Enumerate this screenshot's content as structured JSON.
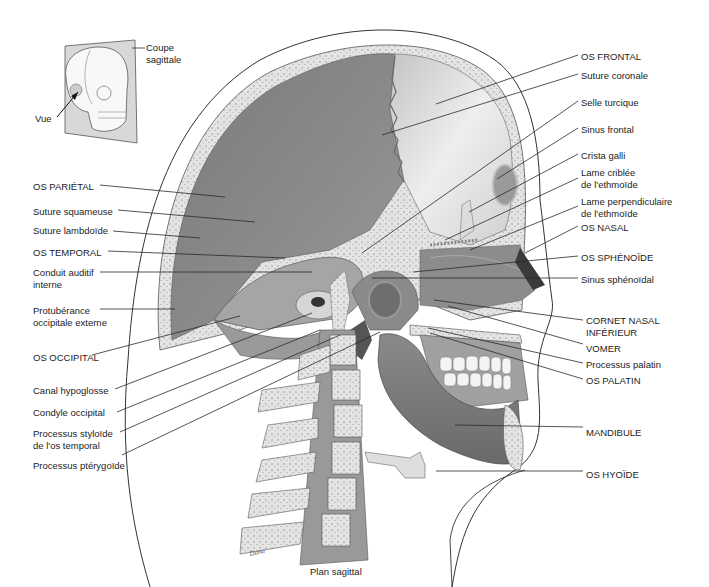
{
  "diagram": {
    "type": "anatomical-illustration",
    "caption": "Plan sagittal",
    "inset": {
      "plane_label": "Coupe\nsagittale",
      "view_label": "Vue"
    },
    "colors": {
      "background": "#ffffff",
      "bone_dark": "#6f6f6f",
      "bone_mid": "#9a9a9a",
      "bone_light": "#d9d9d9",
      "spongy": "#e6e6e6",
      "leader_line": "#2a2a2a"
    },
    "labels_left": [
      {
        "text": "OS PARIÉTAL",
        "x": 33,
        "y": 181
      },
      {
        "text": "Suture squameuse",
        "x": 33,
        "y": 206
      },
      {
        "text": "Suture lambdoïde",
        "x": 33,
        "y": 225
      },
      {
        "text": "OS TEMPORAL",
        "x": 33,
        "y": 247
      },
      {
        "text": "Conduit auditif\ninterne",
        "x": 33,
        "y": 267
      },
      {
        "text": "Protubérance\noccipitale externe",
        "x": 33,
        "y": 305
      },
      {
        "text": "OS OCCIPITAL",
        "x": 33,
        "y": 352
      },
      {
        "text": "Canal hypoglosse",
        "x": 33,
        "y": 385
      },
      {
        "text": "Condyle occipital",
        "x": 33,
        "y": 407
      },
      {
        "text": "Processus styloïde\nde l'os temporal",
        "x": 33,
        "y": 428
      },
      {
        "text": "Processus ptérygoïde",
        "x": 33,
        "y": 460
      }
    ],
    "labels_right": [
      {
        "text": "OS FRONTAL",
        "x": 581,
        "y": 51
      },
      {
        "text": "Suture coronale",
        "x": 581,
        "y": 70
      },
      {
        "text": "Selle turcique",
        "x": 581,
        "y": 97
      },
      {
        "text": "Sinus frontal",
        "x": 581,
        "y": 124
      },
      {
        "text": "Crista galli",
        "x": 581,
        "y": 150
      },
      {
        "text": "Lame criblée\nde l'ethmoïde",
        "x": 581,
        "y": 167
      },
      {
        "text": "Lame perpendiculaire\nde l'ethmoïde",
        "x": 581,
        "y": 196
      },
      {
        "text": "OS NASAL",
        "x": 581,
        "y": 222
      },
      {
        "text": "OS SPHÉNOÏDE",
        "x": 581,
        "y": 252
      },
      {
        "text": "Sinus sphénoïdal",
        "x": 581,
        "y": 274
      },
      {
        "text": "CORNET NASAL\nINFÉRIEUR",
        "x": 586,
        "y": 315
      },
      {
        "text": "VOMER",
        "x": 586,
        "y": 343
      },
      {
        "text": "Processus palatin",
        "x": 586,
        "y": 359
      },
      {
        "text": "OS PALATIN",
        "x": 586,
        "y": 375
      },
      {
        "text": "MANDIBULE",
        "x": 586,
        "y": 427
      },
      {
        "text": "OS HYOÏDE",
        "x": 586,
        "y": 469
      }
    ]
  }
}
